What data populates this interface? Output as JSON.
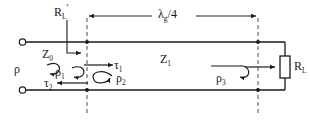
{
  "figure": {
    "type": "quarter-wave-transformer-transmission-line",
    "title": "",
    "background_color": "#ffffff",
    "line_color": "#1a1a1a",
    "dash_color": "#555555"
  },
  "labels": {
    "load_prime": {
      "base": "R",
      "sub": "L",
      "prime": "′"
    },
    "dimension": {
      "base": "λ",
      "sub": "g",
      "tail": "/4"
    },
    "z_source": {
      "base": "Z",
      "sub": "0"
    },
    "z_line": {
      "base": "Z",
      "sub": "1"
    },
    "rho": {
      "base": "ρ",
      "sub": ""
    },
    "rho1": {
      "base": "ρ",
      "sub": "1"
    },
    "rho2": {
      "base": "ρ",
      "sub": "2"
    },
    "rho3": {
      "base": "ρ",
      "sub": "3"
    },
    "tau1": {
      "base": "τ",
      "sub": "1"
    },
    "tau2": {
      "base": "τ",
      "sub": "2"
    },
    "load": {
      "base": "R",
      "sub": "L"
    }
  },
  "geometry": {
    "top_rail_y": 42,
    "bottom_rail_y": 90,
    "left_terminal_x": 22,
    "right_wall_x": 285,
    "dash_left_x": 87,
    "dash_right_x": 258,
    "dim_line_y": 16,
    "resistor_x": 285,
    "resistor_y": 66
  }
}
